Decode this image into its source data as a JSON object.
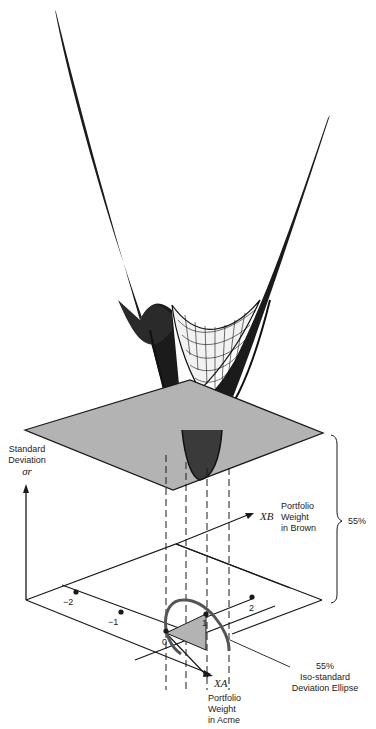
{
  "diagram": {
    "y_axis": {
      "label_line1": "Standard",
      "label_line2": "Deviation",
      "symbol": "σr"
    },
    "xb_axis": {
      "symbol": "XB",
      "label_line1": "Portfolio",
      "label_line2": "Weight",
      "label_line3": "in Brown"
    },
    "xa_axis": {
      "symbol": "XA",
      "label_line1": "Portfolio",
      "label_line2": "Weight",
      "label_line3": "in Acme"
    },
    "ticks": {
      "neg2": "−2",
      "neg1": "−1",
      "zero": "0",
      "one": "1",
      "two": "2"
    },
    "brace_label": "55%",
    "ellipse_label": {
      "line1": "55%",
      "line2": "Iso-standard",
      "line3": "Deviation Ellipse"
    },
    "colors": {
      "plane_fill": "#b3b3b3",
      "line": "#1a1a1a",
      "ellipse": "#555555"
    }
  }
}
